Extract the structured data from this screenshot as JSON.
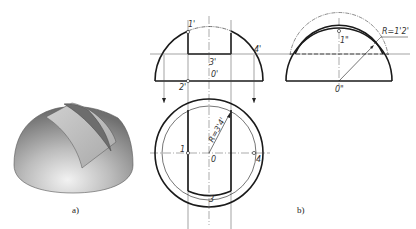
{
  "figure": {
    "panel_a": {
      "caption": "a)",
      "description": "3D shaded hemisphere with slot cut"
    },
    "panel_b": {
      "caption": "b)",
      "front_view_labels": {
        "p1": "1'",
        "p2": "2'",
        "p3": "3'",
        "p4": "4'",
        "center": "0'"
      },
      "side_view_labels": {
        "p1": "1\"",
        "center": "0\"",
        "radius": "R=1'2'"
      },
      "top_view_labels": {
        "p1": "1",
        "p3": "3",
        "p4": "4",
        "center": "0",
        "radius": "R=3'4'"
      }
    },
    "colors": {
      "line": "#1a1a1a",
      "thin": "#444444",
      "sphere_light": "#d8d8d8",
      "sphere_dark": "#7a7a7a",
      "slot_face": "#c4c4c4",
      "slot_inner": "#6e6e6e"
    }
  }
}
